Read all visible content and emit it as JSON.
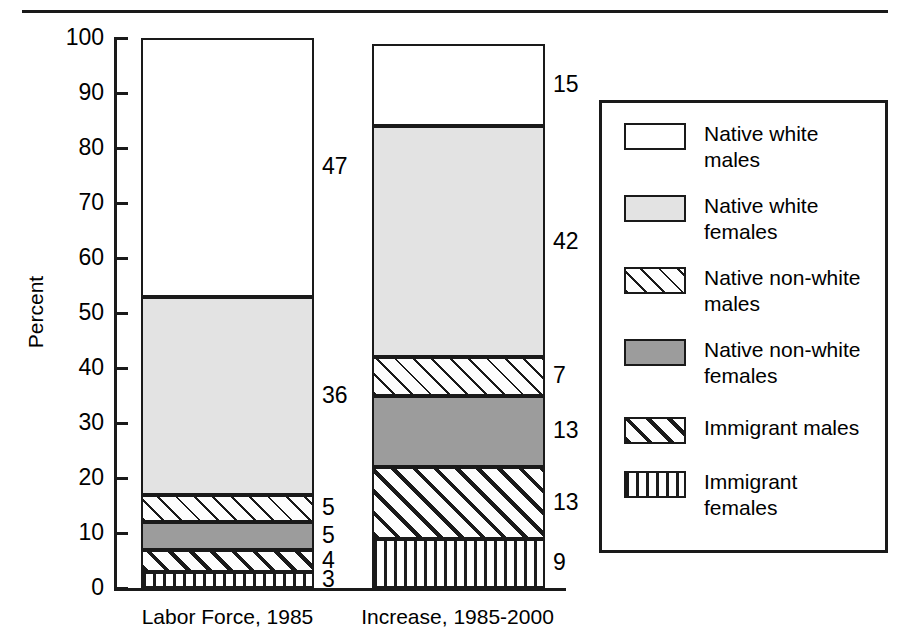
{
  "chart_data": {
    "type": "bar",
    "subtype": "stacked-bar-100-percent",
    "title": "",
    "xlabel": "",
    "ylabel": "Percent",
    "ylim": [
      0,
      100
    ],
    "ytick_step": 10,
    "yticks": [
      0,
      10,
      20,
      30,
      40,
      50,
      60,
      70,
      80,
      90,
      100
    ],
    "ytick_labels": [
      "0",
      "10",
      "20",
      "30",
      "40",
      "50",
      "60",
      "70",
      "80",
      "90",
      "100"
    ],
    "grid": false,
    "legend_position": "right",
    "categories": [
      "Labor Force, 1985",
      "Increase, 1985-2000"
    ],
    "series": [
      {
        "name": "Native white males",
        "pattern": "white",
        "values": [
          47,
          15
        ],
        "labels": [
          "47",
          "15"
        ]
      },
      {
        "name": "Native white females",
        "pattern": "light-gray",
        "values": [
          36,
          42
        ],
        "labels": [
          "36",
          "42"
        ]
      },
      {
        "name": "Native non-white males",
        "pattern": "thin-diagonal-hatch",
        "values": [
          5,
          7
        ],
        "labels": [
          "5",
          "7"
        ]
      },
      {
        "name": "Native non-white females",
        "pattern": "dark-gray",
        "values": [
          5,
          13
        ],
        "labels": [
          "5",
          "13"
        ]
      },
      {
        "name": "Immigrant males",
        "pattern": "thick-diagonal-hatch",
        "values": [
          4,
          13
        ],
        "labels": [
          "4",
          "13"
        ]
      },
      {
        "name": "Immigrant females",
        "pattern": "vertical-stripe",
        "values": [
          3,
          9
        ],
        "labels": [
          "3",
          "9"
        ]
      }
    ],
    "stack_order_bottom_to_top": [
      "Immigrant females",
      "Immigrant males",
      "Native non-white females",
      "Native non-white males",
      "Native white females",
      "Native white males"
    ]
  },
  "axis": {
    "y_title": "Percent",
    "tick_labels": [
      "100",
      "90",
      "80",
      "70",
      "60",
      "50",
      "40",
      "30",
      "20",
      "10",
      "0"
    ]
  },
  "bars": {
    "labor_force": {
      "category_label": "Labor Force, 1985",
      "segments": [
        {
          "name": "native-white-males",
          "label": "47"
        },
        {
          "name": "native-white-females",
          "label": "36"
        },
        {
          "name": "native-non-white-males",
          "label": "5"
        },
        {
          "name": "native-non-white-females",
          "label": "5"
        },
        {
          "name": "immigrant-males",
          "label": "4"
        },
        {
          "name": "immigrant-females",
          "label": "3"
        }
      ]
    },
    "increase": {
      "category_label": "Increase, 1985-2000",
      "segments": [
        {
          "name": "native-white-males",
          "label": "15"
        },
        {
          "name": "native-white-females",
          "label": "42"
        },
        {
          "name": "native-non-white-males",
          "label": "7"
        },
        {
          "name": "native-non-white-females",
          "label": "13"
        },
        {
          "name": "immigrant-males",
          "label": "13"
        },
        {
          "name": "immigrant-females",
          "label": "9"
        }
      ]
    }
  },
  "legend": {
    "items": [
      {
        "label": "Native white\nmales",
        "pattern": "white"
      },
      {
        "label": "Native white\nfemales",
        "pattern": "light-gray"
      },
      {
        "label": "Native non-white\nmales",
        "pattern": "thin-diagonal-hatch"
      },
      {
        "label": "Native non-white\nfemales",
        "pattern": "dark-gray"
      },
      {
        "label": "Immigrant males",
        "pattern": "thick-diagonal-hatch"
      },
      {
        "label": "Immigrant\nfemales",
        "pattern": "vertical-stripe"
      }
    ]
  },
  "colors": {
    "ink": "#1a1a1a",
    "light_gray": "#e3e3e3",
    "dark_gray": "#9c9c9c",
    "background": "#ffffff"
  }
}
